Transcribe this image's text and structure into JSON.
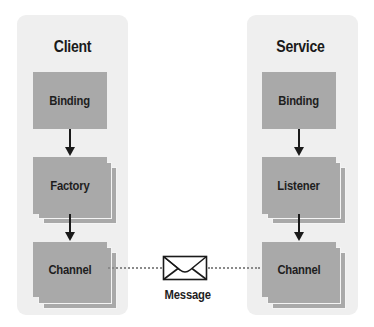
{
  "diagram": {
    "client": {
      "title": "Client",
      "components": [
        "Binding",
        "Factory",
        "Channel"
      ]
    },
    "service": {
      "title": "Service",
      "components": [
        "Binding",
        "Listener",
        "Channel"
      ]
    },
    "message": {
      "label": "Message",
      "icon": "envelope-icon"
    },
    "colors": {
      "panel_bg": "#efefef",
      "box_fill": "#a9a9a9",
      "text": "#1e1e1e",
      "arrow": "#1a1a1a",
      "dots": "#8a8a8a"
    }
  }
}
